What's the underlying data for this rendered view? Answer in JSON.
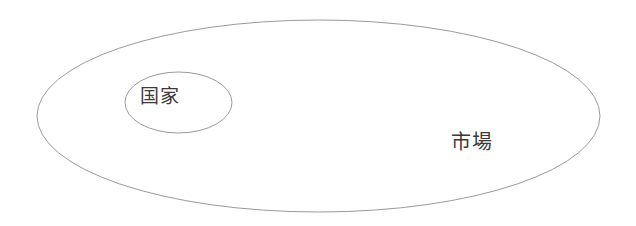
{
  "diagram": {
    "type": "nested-venn",
    "background_color": "#ffffff",
    "stroke_color": "#9a9a9a",
    "text_color": "#3a3a3a",
    "regions": [
      {
        "id": "outer",
        "label": "市場",
        "shape": "ellipse",
        "cx": 318.5,
        "cy": 116,
        "rx": 281.5,
        "ry": 96,
        "label_x": 451,
        "label_y": 132,
        "font_size": 20
      },
      {
        "id": "inner",
        "label": "国家",
        "shape": "ellipse",
        "cx": 178.5,
        "cy": 102.5,
        "rx": 53.5,
        "ry": 30.5,
        "label_x": 140,
        "label_y": 87,
        "font_size": 19
      }
    ]
  }
}
